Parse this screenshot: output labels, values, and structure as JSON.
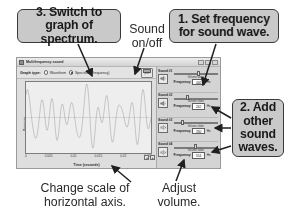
{
  "callouts": {
    "spectrum": "3. Switch to graph of spectrum.",
    "frequency": "1. Set frequency for sound wave.",
    "add_waves": "2. Add other sound waves."
  },
  "captions": {
    "sound_on_off": "Sound on/off",
    "change_scale": "Change scale of horizontal axis.",
    "adjust_volume": "Adjust volume."
  },
  "window": {
    "title": "Multifrequency sound",
    "minimize_label": "_",
    "maximize_label": "□",
    "close_label": "✕"
  },
  "toolbar": {
    "graph_type_label": "Graph type:",
    "options": [
      {
        "label": "Waveform",
        "selected": false
      },
      {
        "label": "Spectrum (frequency)",
        "selected": true
      }
    ],
    "print_label": "print"
  },
  "chart_data": {
    "type": "line",
    "title": "",
    "xlabel": "Time (seconds)",
    "ylabel": "Pressure",
    "xticks": [
      "0",
      "0.005",
      "0.01",
      "0.015",
      "0.02",
      "0.025"
    ],
    "xlim": [
      0,
      0.025
    ],
    "ylim": [
      -1,
      1
    ],
    "grid": false,
    "series": [
      {
        "name": "Combined pressure wave",
        "description": "Dense oscillation with beating envelope; sum of four sine components",
        "components_hz": [
          440,
          262,
          330,
          554
        ]
      }
    ]
  },
  "scale_control": {
    "decrease_label": "◂",
    "increase_label": "▸"
  },
  "sounds": [
    {
      "title": "Sound #1",
      "speaker_icon": "speaker-on-icon",
      "enabled": true,
      "volume_label": "Volume slider",
      "volume_percent": 52,
      "frequency_label": "Frequency",
      "frequency_value": "440",
      "unit": "Hz"
    },
    {
      "title": "Sound #2",
      "speaker_icon": "speaker-on-icon",
      "enabled": true,
      "volume_label": "Volume slider",
      "volume_percent": 30,
      "frequency_label": "Frequency",
      "frequency_value": "262",
      "unit": "Hz"
    },
    {
      "title": "Sound #3",
      "speaker_icon": "speaker-off-icon",
      "enabled": false,
      "volume_label": "Volume slider",
      "volume_percent": 18,
      "frequency_label": "Frequency",
      "frequency_value": "330",
      "unit": "Hz"
    },
    {
      "title": "Sound #4",
      "speaker_icon": "speaker-off-icon",
      "enabled": false,
      "volume_label": "Volume slider",
      "volume_percent": 46,
      "frequency_label": "Frequency",
      "frequency_value": "554",
      "unit": "Hz"
    }
  ],
  "colors": {
    "callout_fill": "#c9c9c9",
    "callout_border": "#3a3a3a",
    "window_chrome": "#dedede",
    "panel": "#d4d4d4",
    "plot_bg": "#eeeeee",
    "text": "#1a1a1a"
  }
}
